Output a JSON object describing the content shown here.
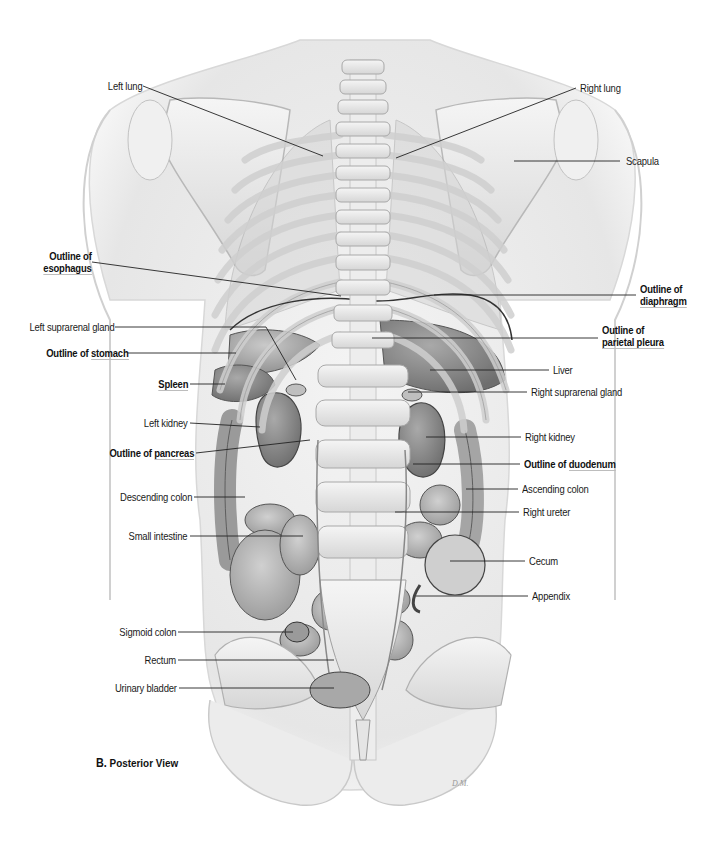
{
  "figure": {
    "caption_letter": "B.",
    "caption_text": "Posterior View",
    "signature": "D.M."
  },
  "labels_left": [
    {
      "id": "left-lung",
      "text": "Left lung",
      "bold": false
    },
    {
      "id": "outline-esophagus",
      "line1": "Outline of",
      "line2": "esophagus",
      "bold": true
    },
    {
      "id": "left-suprarenal-gland",
      "text": "Left suprarenal gland",
      "bold": false
    },
    {
      "id": "outline-stomach",
      "prefix": "Outline of ",
      "text": "stomach",
      "bold": true
    },
    {
      "id": "spleen",
      "text": "Spleen",
      "bold": true
    },
    {
      "id": "left-kidney",
      "text": "Left kidney",
      "bold": false
    },
    {
      "id": "outline-pancreas",
      "prefix": "Outline of ",
      "text": "pancreas",
      "bold": true
    },
    {
      "id": "descending-colon",
      "text": "Descending colon",
      "bold": false
    },
    {
      "id": "small-intestine",
      "text": "Small intestine",
      "bold": false
    },
    {
      "id": "sigmoid-colon",
      "text": "Sigmoid colon",
      "bold": false
    },
    {
      "id": "rectum",
      "text": "Rectum",
      "bold": false
    },
    {
      "id": "urinary-bladder",
      "text": "Urinary bladder",
      "bold": false
    }
  ],
  "labels_right": [
    {
      "id": "right-lung",
      "text": "Right lung",
      "bold": false
    },
    {
      "id": "scapula",
      "text": "Scapula",
      "bold": false
    },
    {
      "id": "outline-diaphragm",
      "line1": "Outline of",
      "line2": "diaphragm",
      "bold": true
    },
    {
      "id": "outline-parietal-pleura",
      "line1": "Outline of",
      "line2": "parietal pleura",
      "bold": true
    },
    {
      "id": "liver",
      "text": "Liver",
      "bold": false
    },
    {
      "id": "right-suprarenal-gland",
      "text": "Right suprarenal gland",
      "bold": false
    },
    {
      "id": "right-kidney",
      "text": "Right kidney",
      "bold": false
    },
    {
      "id": "outline-duodenum",
      "prefix": "Outline of ",
      "text": "duodenum",
      "bold": true
    },
    {
      "id": "ascending-colon",
      "text": "Ascending colon",
      "bold": false
    },
    {
      "id": "right-ureter",
      "text": "Right ureter",
      "bold": false
    },
    {
      "id": "cecum",
      "text": "Cecum",
      "bold": false
    },
    {
      "id": "appendix",
      "text": "Appendix",
      "bold": false
    }
  ],
  "colors": {
    "background": "#ffffff",
    "label_text": "#1a1a1a",
    "leader_line": "#222222",
    "underline": "#bdbdbd"
  }
}
